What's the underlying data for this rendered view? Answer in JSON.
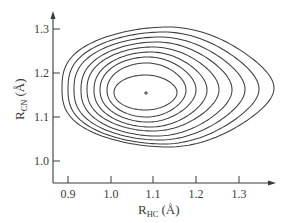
{
  "chart_data": {
    "type": "contour",
    "title": "",
    "xlabel": "R_HC (Å)",
    "xlabel_main": "R",
    "xlabel_sub": "HC",
    "xlabel_unit": "(Å)",
    "ylabel": "R_CN (Å)",
    "ylabel_main": "R",
    "ylabel_sub": "CN",
    "ylabel_unit": "(Å)",
    "x_ticks": [
      "0.9",
      "1.0",
      "1.1",
      "1.2",
      "1.3"
    ],
    "y_ticks": [
      "1.0",
      "1.1",
      "1.2",
      "1.3"
    ],
    "xlim": [
      0.86,
      1.39
    ],
    "ylim": [
      0.92,
      1.35
    ],
    "grid": false,
    "legend": null,
    "minimum": {
      "x": 1.08,
      "y": 1.16,
      "marker": "+"
    },
    "contour_count": 9,
    "contours": [
      {
        "level": 1,
        "x_min": 1.01,
        "x_max": 1.16,
        "y_min": 1.1,
        "y_max": 1.22
      },
      {
        "level": 2,
        "x_min": 0.99,
        "x_max": 1.18,
        "y_min": 1.08,
        "y_max": 1.24
      },
      {
        "level": 3,
        "x_min": 0.97,
        "x_max": 1.2,
        "y_min": 1.07,
        "y_max": 1.25
      },
      {
        "level": 4,
        "x_min": 0.96,
        "x_max": 1.22,
        "y_min": 1.06,
        "y_max": 1.26
      },
      {
        "level": 5,
        "x_min": 0.94,
        "x_max": 1.24,
        "y_min": 1.05,
        "y_max": 1.28
      },
      {
        "level": 6,
        "x_min": 0.93,
        "x_max": 1.27,
        "y_min": 1.04,
        "y_max": 1.29
      },
      {
        "level": 7,
        "x_min": 0.91,
        "x_max": 1.3,
        "y_min": 1.03,
        "y_max": 1.3
      },
      {
        "level": 8,
        "x_min": 0.9,
        "x_max": 1.33,
        "y_min": 1.02,
        "y_max": 1.31
      },
      {
        "level": 9,
        "x_min": 0.89,
        "x_max": 1.37,
        "y_min": 1.01,
        "y_max": 1.33
      }
    ]
  },
  "layout": {
    "origin_px": [
      53,
      183
    ],
    "x_axis_end_px": 274,
    "y_axis_top_px": 13,
    "x_tick_px": [
      68,
      111,
      153,
      196,
      239
    ],
    "y_tick_px": [
      161,
      117,
      73,
      29
    ],
    "center_px": [
      146,
      93
    ],
    "contour_px": [
      {
        "l": 114,
        "r": 177,
        "t": 75,
        "b": 110
      },
      {
        "l": 107,
        "r": 186,
        "t": 63,
        "b": 117
      },
      {
        "l": 100,
        "r": 196,
        "t": 57,
        "b": 122
      },
      {
        "l": 94,
        "r": 207,
        "t": 52,
        "b": 127
      },
      {
        "l": 87,
        "r": 219,
        "t": 47,
        "b": 131
      },
      {
        "l": 81,
        "r": 232,
        "t": 42,
        "b": 136
      },
      {
        "l": 74,
        "r": 245,
        "t": 37,
        "b": 140
      },
      {
        "l": 68,
        "r": 259,
        "t": 32,
        "b": 144
      },
      {
        "l": 62,
        "r": 274,
        "t": 27,
        "b": 147
      }
    ]
  }
}
